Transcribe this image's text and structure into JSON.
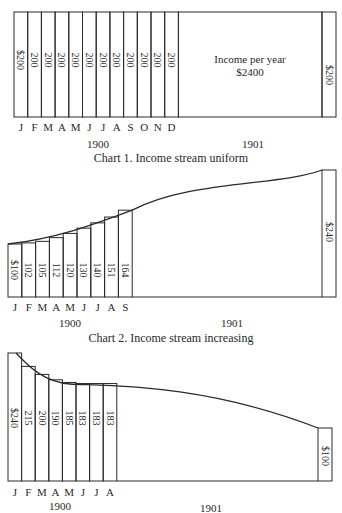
{
  "chart_data": [
    {
      "type": "bar",
      "title": "Chart 1. Income stream uniform",
      "categories": [
        "J",
        "F",
        "M",
        "A",
        "M",
        "J",
        "J",
        "A",
        "S",
        "O",
        "N",
        "D"
      ],
      "values": [
        200,
        200,
        200,
        200,
        200,
        200,
        200,
        200,
        200,
        200,
        200,
        200
      ],
      "value_labels": [
        "$200",
        "200",
        "200",
        "200",
        "200",
        "200",
        "200",
        "200",
        "200",
        "200",
        "200",
        "200"
      ],
      "year_labels": [
        "1900",
        "1901"
      ],
      "annotation_line1": "Income per year",
      "annotation_line2": "$2400",
      "final_bar_label": "$200",
      "final_value": 200
    },
    {
      "type": "bar",
      "title": "Chart 2. Income stream increasing",
      "categories": [
        "J",
        "F",
        "M",
        "A",
        "M",
        "J",
        "J",
        "A",
        "S"
      ],
      "values": [
        100,
        102,
        105,
        112,
        120,
        130,
        140,
        151,
        164
      ],
      "value_labels": [
        "$100",
        "102",
        "105",
        "112",
        "120",
        "130",
        "140",
        "151",
        "164"
      ],
      "year_labels": [
        "1900",
        "1901"
      ],
      "final_bar_label": "$240",
      "final_value": 240
    },
    {
      "type": "bar",
      "title": "",
      "categories": [
        "J",
        "F",
        "M",
        "A",
        "M",
        "J",
        "J",
        "A"
      ],
      "values": [
        240,
        215,
        200,
        190,
        185,
        183,
        183,
        183
      ],
      "value_labels": [
        "$240",
        "215",
        "200",
        "190",
        "185",
        "183",
        "183",
        "183"
      ],
      "year_labels": [
        "1900",
        "1901"
      ],
      "final_bar_label": "$100",
      "final_value": 100
    }
  ],
  "captions": {
    "chart1": "Chart 1. Income stream uniform",
    "chart2": "Chart 2. Income stream increasing"
  },
  "colors": {
    "ink": "#2a2a2a",
    "background": "#ffffff"
  }
}
